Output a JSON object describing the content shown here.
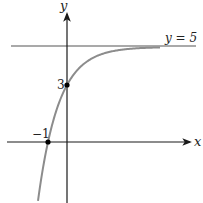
{
  "chart_data": {
    "type": "line",
    "title": "",
    "function": "y = 5 - 2*(2.5)^(-x)",
    "xlabel": "x",
    "ylabel": "y",
    "asymptote": {
      "y": 5,
      "label": "y = 5"
    },
    "points": [
      {
        "x": 0,
        "y": 3,
        "label": "3"
      },
      {
        "x": -1,
        "y": 0,
        "label": "−1"
      }
    ],
    "x_range": [
      -3.5,
      6.9
    ],
    "y_range": [
      -3.2,
      6.9
    ],
    "grid": false,
    "legend": null,
    "colors": {
      "axes": "#1a1a1a",
      "curve": "#8c8c8c",
      "asymptote": "#555555",
      "points": "#000000"
    }
  },
  "labels": {
    "y_axis": "y",
    "x_axis": "x",
    "asymptote": "y = 5",
    "y_intercept": "3",
    "x_intercept": "−1"
  }
}
